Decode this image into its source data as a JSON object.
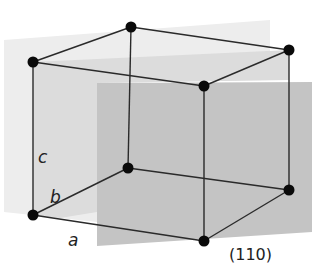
{
  "diagram": {
    "axis_labels": {
      "a": "a",
      "b": "b",
      "c": "c"
    },
    "plane_label": "(110)",
    "colors": {
      "background": "#ffffff",
      "back_plane": "#ededed",
      "left_plane": "#dcdcdc",
      "plane_110": "#c4c4c4",
      "edges": "#2a2a2a",
      "atoms": "#0a0a0a"
    },
    "vertices": [
      {
        "name": "top-back-left",
        "x": 131,
        "y": 27
      },
      {
        "name": "top-front-left",
        "x": 33,
        "y": 62
      },
      {
        "name": "top-back-right",
        "x": 289,
        "y": 50
      },
      {
        "name": "top-front-right",
        "x": 204,
        "y": 86
      },
      {
        "name": "bottom-back-left",
        "x": 128,
        "y": 168
      },
      {
        "name": "bottom-front-left",
        "x": 33,
        "y": 215
      },
      {
        "name": "bottom-back-right",
        "x": 289,
        "y": 190
      },
      {
        "name": "bottom-front-right",
        "x": 204,
        "y": 241
      }
    ]
  }
}
